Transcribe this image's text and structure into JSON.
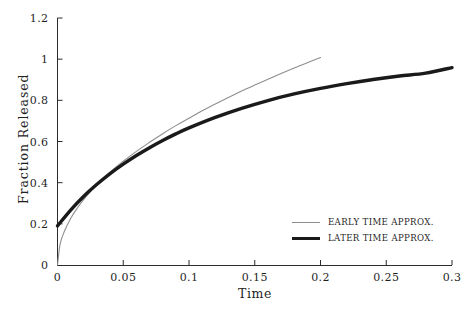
{
  "chart_data": {
    "type": "line",
    "title": "",
    "xlabel": "Time",
    "ylabel": "Fraction Released",
    "xlim": [
      0,
      0.3
    ],
    "ylim": [
      0,
      1.2
    ],
    "xticks": [
      "0",
      "0.05",
      "0.1",
      "0.15",
      "0.2",
      "0.25",
      "0.3"
    ],
    "xtick_values": [
      0,
      0.05,
      0.1,
      0.15,
      0.2,
      0.25,
      0.3
    ],
    "yticks": [
      "0",
      "0.2",
      "0.4",
      "0.6",
      "0.8",
      "1",
      "1.2"
    ],
    "ytick_values": [
      0,
      0.2,
      0.4,
      0.6,
      0.8,
      1,
      1.2
    ],
    "grid": false,
    "legend_position": "lower right",
    "series": [
      {
        "name": "EARLY TIME APPROX.",
        "color": "#8e8e8e",
        "width": 1.1,
        "x": [
          0,
          0.002,
          0.005,
          0.01,
          0.015,
          0.02,
          0.03,
          0.04,
          0.05,
          0.06,
          0.07,
          0.08,
          0.09,
          0.1,
          0.11,
          0.12,
          0.13,
          0.14,
          0.15,
          0.16,
          0.17,
          0.18,
          0.19,
          0.2
        ],
        "y": [
          0,
          0.101,
          0.16,
          0.226,
          0.276,
          0.319,
          0.391,
          0.451,
          0.504,
          0.552,
          0.596,
          0.638,
          0.677,
          0.713,
          0.749,
          0.782,
          0.814,
          0.845,
          0.874,
          0.902,
          0.93,
          0.957,
          0.983,
          1.008
        ]
      },
      {
        "name": "LATER TIME APPROX.",
        "color": "#1a1a1a",
        "width": 3.4,
        "x": [
          0,
          0.01,
          0.02,
          0.03,
          0.04,
          0.05,
          0.06,
          0.07,
          0.08,
          0.09,
          0.1,
          0.12,
          0.14,
          0.16,
          0.18,
          0.2,
          0.22,
          0.24,
          0.26,
          0.28,
          0.3
        ],
        "y": [
          0.19,
          0.267,
          0.334,
          0.392,
          0.444,
          0.49,
          0.532,
          0.57,
          0.605,
          0.637,
          0.666,
          0.717,
          0.761,
          0.799,
          0.831,
          0.858,
          0.881,
          0.901,
          0.918,
          0.932,
          0.959
        ]
      }
    ]
  },
  "legend": {
    "entries": [
      {
        "label": "EARLY TIME APPROX."
      },
      {
        "label": "LATER TIME APPROX."
      }
    ]
  }
}
